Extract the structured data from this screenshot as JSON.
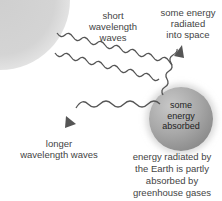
{
  "diagram": {
    "labels": {
      "short_waves": "short wavelength waves",
      "radiated_space": "some energy radiated into space",
      "absorbed": "some energy absorbed",
      "longer_waves": "longer wavelength waves",
      "greenhouse": "energy radiated by the Earth is partly absorbed by greenhouse gases"
    },
    "label_lines": {
      "short_waves": [
        "short",
        "wavelength",
        "waves"
      ],
      "radiated_space": [
        "some energy",
        "radiated",
        "into space"
      ],
      "absorbed": [
        "some",
        "energy",
        "absorbed"
      ],
      "longer_waves": [
        "longer",
        "wavelength waves"
      ],
      "greenhouse": [
        "energy radiated by",
        "the Earth is partly",
        "absorbed by",
        "greenhouse gases"
      ]
    },
    "colors": {
      "wave": "#555555",
      "sun": "#d0d0d0",
      "earth": "#999999"
    }
  }
}
